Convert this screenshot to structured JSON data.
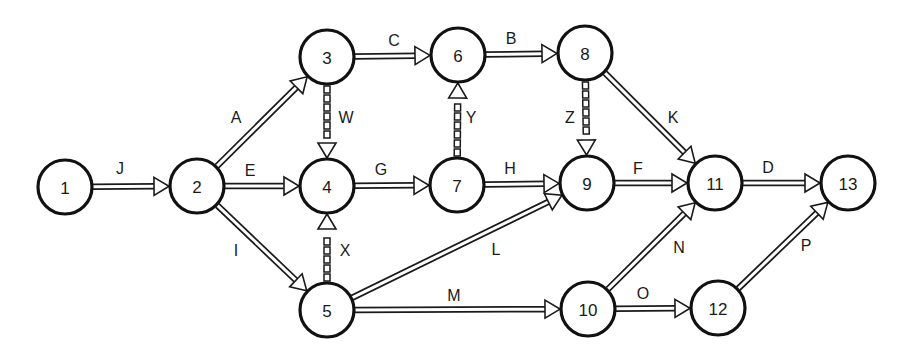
{
  "diagram": {
    "title": "",
    "type": "activity-on-arrow network",
    "style": {
      "stroke_color": "#1a1a1a",
      "background": "#ffffff",
      "node_radius": 27
    },
    "nodes": [
      {
        "id": "1",
        "label": "1",
        "x": 65,
        "y": 187
      },
      {
        "id": "2",
        "label": "2",
        "x": 197,
        "y": 186
      },
      {
        "id": "3",
        "label": "3",
        "x": 327,
        "y": 57
      },
      {
        "id": "4",
        "label": "4",
        "x": 327,
        "y": 186
      },
      {
        "id": "5",
        "label": "5",
        "x": 327,
        "y": 310
      },
      {
        "id": "6",
        "label": "6",
        "x": 458,
        "y": 55
      },
      {
        "id": "7",
        "label": "7",
        "x": 457,
        "y": 185
      },
      {
        "id": "8",
        "label": "8",
        "x": 585,
        "y": 53
      },
      {
        "id": "9",
        "label": "9",
        "x": 587,
        "y": 183
      },
      {
        "id": "10",
        "label": "10",
        "x": 588,
        "y": 309
      },
      {
        "id": "11",
        "label": "11",
        "x": 715,
        "y": 183
      },
      {
        "id": "12",
        "label": "12",
        "x": 718,
        "y": 308
      },
      {
        "id": "13",
        "label": "13",
        "x": 848,
        "y": 183
      }
    ],
    "edges": [
      {
        "label": "J",
        "from": "1",
        "to": "2",
        "dummy": false,
        "lx": 120,
        "ly": 168
      },
      {
        "label": "A",
        "from": "2",
        "to": "3",
        "dummy": false,
        "lx": 236,
        "ly": 117
      },
      {
        "label": "E",
        "from": "2",
        "to": "4",
        "dummy": false,
        "lx": 250,
        "ly": 170
      },
      {
        "label": "I",
        "from": "2",
        "to": "5",
        "dummy": false,
        "lx": 236,
        "ly": 250
      },
      {
        "label": "C",
        "from": "3",
        "to": "6",
        "dummy": false,
        "lx": 394,
        "ly": 40
      },
      {
        "label": "W",
        "from": "3",
        "to": "4",
        "dummy": true,
        "lx": 346,
        "ly": 117
      },
      {
        "label": "G",
        "from": "4",
        "to": "7",
        "dummy": false,
        "lx": 381,
        "ly": 169
      },
      {
        "label": "X",
        "from": "5",
        "to": "4",
        "dummy": true,
        "lx": 345,
        "ly": 250
      },
      {
        "label": "L",
        "from": "5",
        "to": "9",
        "dummy": false,
        "lx": 496,
        "ly": 249
      },
      {
        "label": "M",
        "from": "5",
        "to": "10",
        "dummy": false,
        "lx": 454,
        "ly": 295
      },
      {
        "label": "B",
        "from": "6",
        "to": "8",
        "dummy": false,
        "lx": 511,
        "ly": 38
      },
      {
        "label": "Y",
        "from": "7",
        "to": "6",
        "dummy": true,
        "lx": 471,
        "ly": 117
      },
      {
        "label": "H",
        "from": "7",
        "to": "9",
        "dummy": false,
        "lx": 510,
        "ly": 168
      },
      {
        "label": "Z",
        "from": "8",
        "to": "9",
        "dummy": true,
        "lx": 570,
        "ly": 117
      },
      {
        "label": "K",
        "from": "8",
        "to": "11",
        "dummy": false,
        "lx": 673,
        "ly": 117
      },
      {
        "label": "F",
        "from": "9",
        "to": "11",
        "dummy": false,
        "lx": 638,
        "ly": 168
      },
      {
        "label": "N",
        "from": "10",
        "to": "11",
        "dummy": false,
        "lx": 679,
        "ly": 247
      },
      {
        "label": "O",
        "from": "10",
        "to": "12",
        "dummy": false,
        "lx": 643,
        "ly": 293
      },
      {
        "label": "D",
        "from": "11",
        "to": "13",
        "dummy": false,
        "lx": 768,
        "ly": 167
      },
      {
        "label": "P",
        "from": "12",
        "to": "13",
        "dummy": false,
        "lx": 806,
        "ly": 245
      }
    ]
  }
}
